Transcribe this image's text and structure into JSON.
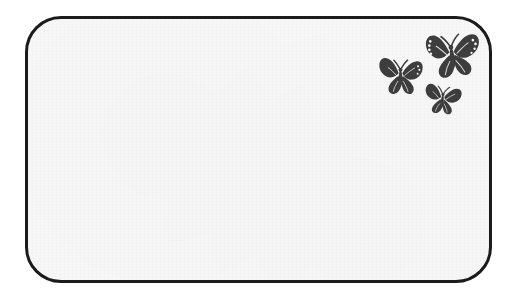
{
  "canvas": {
    "width": 511,
    "height": 298,
    "background_color": "#ffffff"
  },
  "frame": {
    "name": "rounded-note-card",
    "shape": "rounded-rectangle",
    "border_color": "#1b1b1b",
    "border_width_px": 3,
    "corner_radius_px": 36,
    "fill_color": "#f7f7f7",
    "left_px": 25,
    "top_px": 16,
    "width_px": 467,
    "height_px": 267,
    "note_text": "",
    "note_placeholder": ""
  },
  "decoration": {
    "motif": "butterflies",
    "color": "#3d3d3d",
    "cluster_position": "top-right",
    "count": 3,
    "butterflies": [
      {
        "id": "butterfly-large",
        "size": "large",
        "left_px": 421,
        "top_px": 29,
        "width_px": 62,
        "height_px": 52,
        "rotation_deg": -8,
        "has_wing_spots": true,
        "icon": "butterfly-icon"
      },
      {
        "id": "butterfly-medium",
        "size": "medium",
        "left_px": 374,
        "top_px": 54,
        "width_px": 53,
        "height_px": 44,
        "rotation_deg": 0,
        "has_wing_spots": true,
        "icon": "butterfly-icon"
      },
      {
        "id": "butterfly-small",
        "size": "small",
        "left_px": 420,
        "top_px": 80,
        "width_px": 45,
        "height_px": 38,
        "rotation_deg": 6,
        "has_wing_spots": false,
        "icon": "butterfly-icon"
      }
    ]
  }
}
